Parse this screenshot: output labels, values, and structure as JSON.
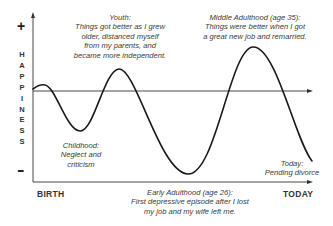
{
  "diagram": {
    "y_axis": {
      "label": "HAPPINESS",
      "letters": [
        "H",
        "A",
        "P",
        "P",
        "I",
        "N",
        "E",
        "S",
        "S"
      ],
      "top_sign": "+",
      "bottom_sign": "-"
    },
    "x_axis": {
      "start_label": "BIRTH",
      "end_label": "TODAY"
    },
    "annotations": {
      "youth": {
        "title": "Youth:",
        "lines": [
          "Things got better as I grew",
          "older, distanced myself",
          "from my parents, and",
          "became more independent."
        ]
      },
      "middle_adulthood": {
        "title": "Middle Adulthood (age 35):",
        "lines": [
          "Things were better when I got",
          "a great new job and remarried."
        ]
      },
      "childhood": {
        "title": "Childhood:",
        "lines": [
          "Neglect and",
          "criticism"
        ]
      },
      "early_adulthood": {
        "title": "Early Adulthood (age 26):",
        "lines": [
          "First depressive episode after I lost",
          "my job and my wife left me."
        ]
      },
      "today": {
        "title": "Today:",
        "lines": [
          "Pending divorce"
        ]
      }
    },
    "colors": {
      "line": "#1a1a1a",
      "axis": "#333333",
      "text": "#3a3a3a"
    }
  }
}
